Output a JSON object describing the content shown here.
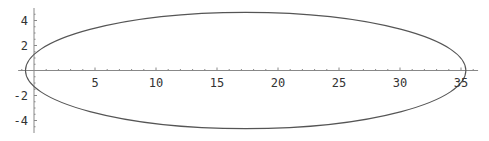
{
  "chart_data": {
    "type": "line",
    "title": "",
    "xlabel": "",
    "ylabel": "",
    "series": [
      {
        "name": "ellipse",
        "shape": "ellipse",
        "center": [
          17.35,
          0
        ],
        "semi_axis_x": 18.05,
        "semi_axis_y": 4.65
      }
    ],
    "xlim": [
      -1.3,
      36.4
    ],
    "ylim": [
      -5,
      5
    ],
    "x_ticks": [
      5,
      10,
      15,
      20,
      25,
      30,
      35
    ],
    "x_tick_labels": [
      "5",
      "10",
      "15",
      "20",
      "25",
      "30",
      "35"
    ],
    "y_ticks": [
      -4,
      -2,
      2,
      4
    ],
    "y_tick_labels": [
      "-4",
      "-2",
      "2",
      "4"
    ],
    "grid": false,
    "legend": null,
    "colors": {
      "curve": "#555555",
      "axis": "#888888",
      "background": "#ffffff"
    }
  }
}
